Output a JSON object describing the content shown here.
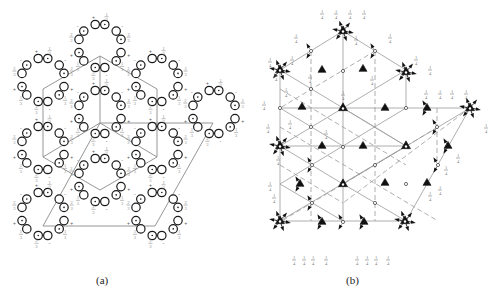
{
  "figure": {
    "panels": [
      {
        "id": "a",
        "label": "(a)",
        "label_pos": [
          103,
          286
        ],
        "description": "Equivalent positions diagram: rings of paired circles with +/- signs and fractional heights",
        "cell_outline": {
          "hexagon": [
            [
              100,
              56
            ],
            [
              157,
              89
            ],
            [
              157,
              157
            ],
            [
              100,
              190
            ],
            [
              43,
              157
            ],
            [
              43,
              89
            ]
          ],
          "inner_lines": [
            [
              [
                100,
                56
              ],
              [
                100,
                123
              ]
            ],
            [
              [
                100,
                123
              ],
              [
                157,
                157
              ]
            ],
            [
              [
                100,
                123
              ],
              [
                43,
                157
              ]
            ]
          ],
          "parallelogram": [
            [
              100,
              123
            ],
            [
              213,
              123
            ],
            [
              155,
              226
            ],
            [
              43,
              226
            ]
          ]
        },
        "ring_centers": [
          [
            100,
            46
          ],
          [
            43,
            80
          ],
          [
            157,
            80
          ],
          [
            100,
            112
          ],
          [
            43,
            148
          ],
          [
            157,
            148
          ],
          [
            214,
            112
          ],
          [
            100,
            180
          ],
          [
            43,
            214
          ],
          [
            157,
            214
          ]
        ],
        "ring_radius": 22,
        "height_labels": [
          "1/3",
          "2/3",
          "+",
          "-"
        ]
      },
      {
        "id": "b",
        "label": "(b)",
        "label_pos": [
          353,
          286
        ],
        "description": "Symmetry elements diagram: 3-bar axes (open triangles), 3-fold axes (filled triangles), inversion centers (small circles), glide/mirror lines, fractional heights",
        "outline": [
          [
            280,
            70
          ],
          [
            343,
            31
          ],
          [
            406,
            70
          ],
          [
            406,
            108
          ],
          [
            470,
            108
          ],
          [
            406,
            221
          ],
          [
            280,
            221
          ]
        ],
        "solid_lines": [
          [
            [
              280,
              70
            ],
            [
              343,
              31
            ]
          ],
          [
            [
              343,
              31
            ],
            [
              406,
              70
            ]
          ],
          [
            [
              406,
              70
            ],
            [
              406,
              108
            ]
          ],
          [
            [
              406,
              108
            ],
            [
              470,
              108
            ]
          ],
          [
            [
              470,
              108
            ],
            [
              406,
              221
            ]
          ],
          [
            [
              406,
              221
            ],
            [
              280,
              221
            ]
          ],
          [
            [
              280,
              221
            ],
            [
              280,
              70
            ]
          ],
          [
            [
              343,
              31
            ],
            [
              343,
              221
            ]
          ],
          [
            [
              280,
              108
            ],
            [
              406,
              108
            ]
          ],
          [
            [
              280,
              146
            ],
            [
              406,
              146
            ]
          ],
          [
            [
              280,
              70
            ],
            [
              406,
              146
            ]
          ],
          [
            [
              280,
              146
            ],
            [
              343,
              184
            ]
          ],
          [
            [
              343,
              108
            ],
            [
              406,
              146
            ]
          ],
          [
            [
              280,
              108
            ],
            [
              343,
              146
            ]
          ],
          [
            [
              406,
              70
            ],
            [
              280,
              146
            ]
          ],
          [
            [
              406,
              108
            ],
            [
              280,
              184
            ]
          ],
          [
            [
              406,
              146
            ],
            [
              280,
              221
            ]
          ],
          [
            [
              470,
              108
            ],
            [
              343,
              184
            ]
          ],
          [
            [
              343,
              184
            ],
            [
              406,
              221
            ]
          ],
          [
            [
              280,
              184
            ],
            [
              343,
              221
            ]
          ]
        ],
        "dashed_lines": [
          [
            [
              311,
              51
            ],
            [
              311,
              221
            ]
          ],
          [
            [
              375,
              51
            ],
            [
              375,
              221
            ]
          ],
          [
            [
              437,
              108
            ],
            [
              437,
              165
            ]
          ],
          [
            [
              280,
              89
            ],
            [
              406,
              165
            ]
          ],
          [
            [
              280,
              165
            ],
            [
              343,
              203
            ]
          ],
          [
            [
              280,
              127
            ],
            [
              438,
              221
            ]
          ],
          [
            [
              375,
              51
            ],
            [
              280,
              108
            ]
          ],
          [
            [
              438,
              127
            ],
            [
              280,
              222
            ]
          ],
          [
            [
              470,
              108
            ],
            [
              343,
              203
            ]
          ]
        ],
        "rotoinversion_3bar": [
          [
            343,
            31
          ],
          [
            280,
            70
          ],
          [
            406,
            72
          ],
          [
            343,
            108
          ],
          [
            470,
            108
          ],
          [
            280,
            146
          ],
          [
            406,
            146
          ],
          [
            343,
            184
          ],
          [
            280,
            221
          ],
          [
            405,
            221
          ]
        ],
        "threefold_axes": [
          [
            322,
            70
          ],
          [
            363,
            69
          ],
          [
            302,
            107
          ],
          [
            385,
            108
          ],
          [
            427,
            108
          ],
          [
            322,
            146
          ],
          [
            363,
            146
          ],
          [
            448,
            146
          ],
          [
            300,
            184
          ],
          [
            385,
            183
          ],
          [
            427,
            183
          ],
          [
            322,
            222
          ],
          [
            364,
            222
          ]
        ],
        "inversion_centers": [
          [
            311,
            51
          ],
          [
            375,
            51
          ],
          [
            311,
            89
          ],
          [
            343,
            71
          ],
          [
            280,
            108
          ],
          [
            406,
            108
          ],
          [
            311,
            127
          ],
          [
            437,
            127
          ],
          [
            343,
            147
          ],
          [
            312,
            165
          ],
          [
            375,
            165
          ],
          [
            438,
            165
          ],
          [
            406,
            184
          ],
          [
            312,
            203
          ],
          [
            375,
            203
          ],
          [
            343,
            222
          ]
        ],
        "height_labels": [
          "1/4",
          "1/4",
          "1/4",
          "1/4"
        ]
      }
    ]
  }
}
